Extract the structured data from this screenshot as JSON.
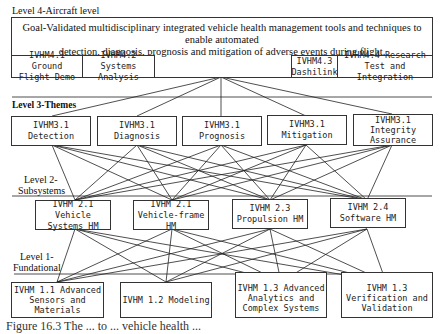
{
  "level4": {
    "label": "Level 4-Aircraft level",
    "goal_line1": "Goal-Validated multidisciplinary integrated vehicle health management tools and techniques to enable automated",
    "goal_line2": "detection, diagnosis, prognosis and mitigation of adverse events during flight.",
    "boxes": [
      {
        "line1": "IVHM4.1 Ground",
        "line2": "Flight Demo"
      },
      {
        "line1": "IVHM4.2 Systems",
        "line2": "Analysis"
      },
      {
        "line1": "IVHM4.3",
        "line2": "Dashilink"
      },
      {
        "line1": "IVHM4.4 Research",
        "line2": "Test and Integration"
      }
    ]
  },
  "level3": {
    "label": "Level 3-Themes",
    "boxes": [
      {
        "line1": "IVHM3.1",
        "line2": "Detection"
      },
      {
        "line1": "IVHM3.1",
        "line2": "Diagnosis"
      },
      {
        "line1": "IVHM3.1",
        "line2": "Prognosis"
      },
      {
        "line1": "IVHM3.1",
        "line2": "Mitigation"
      },
      {
        "line1": "IVHM3.1",
        "line2": "Integrity",
        "line3": "Assurance"
      }
    ]
  },
  "level2": {
    "label_line1": "Level 2-",
    "label_line2": "Subsystems",
    "boxes": [
      {
        "line1": "IVHM 2.1 Vehicle",
        "line2": "Systems HM"
      },
      {
        "line1": "IVHM 2.1",
        "line2": "Vehicle-frame HM"
      },
      {
        "line1": "IVHM 2.3",
        "line2": "Propulsion HM"
      },
      {
        "line1": "IVHM 2.4",
        "line2": "Software HM"
      }
    ]
  },
  "level1": {
    "label_line1": "Level 1-",
    "label_line2": "Fundational",
    "boxes": [
      {
        "line1": "IVHM 1.1 Advanced",
        "line2": "Sensors and",
        "line3": "Materials"
      },
      {
        "line1": "IVHM 1.2 Modeling"
      },
      {
        "line1": "IVHM 1.3 Advanced",
        "line2": "Analytics and",
        "line3": "Complex Systems"
      },
      {
        "line1": "IVHM 1.3",
        "line2": "Verification and",
        "line3": "Validation"
      }
    ]
  },
  "caption": "Figure 16.3  The ...  to ... vehicle health ..."
}
